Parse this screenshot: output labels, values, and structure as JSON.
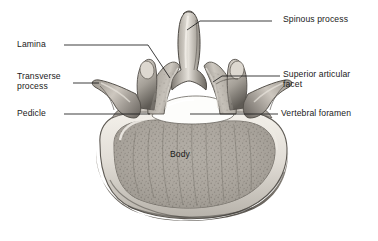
{
  "figure": {
    "view": "superior",
    "background_color": "#ffffff",
    "ink_color": "#1a1a1a",
    "bone_colors": {
      "rim_light": "#f2efe9",
      "bone_mid": "#b9b4ac",
      "bone_dark": "#76716b",
      "shadow": "#4a4742",
      "foramen": "#fdfdfb",
      "trabecular": "#a8a39b"
    }
  },
  "labels": [
    {
      "id": "spinous-process",
      "text": "Spinous process",
      "side": "right",
      "x": 283,
      "y": 14,
      "leader": "M 272 21 L 200 21 L 187 30"
    },
    {
      "id": "lamina",
      "text": "Lamina",
      "side": "left",
      "x": 17,
      "y": 39,
      "leader": "M 64 45 L 148 45 L 170 78"
    },
    {
      "id": "superior-articular-facet",
      "text": "Superior articular\nfacet",
      "side": "right",
      "x": 283,
      "y": 69,
      "leader": "M 280 76 L 222 76 L 213 82"
    },
    {
      "id": "transverse-process",
      "text": "Transverse\nprocess",
      "side": "left",
      "x": 17,
      "y": 71,
      "leader": "M 73 83 L 99 83"
    },
    {
      "id": "pedicle",
      "text": "Pedicle",
      "side": "left",
      "x": 17,
      "y": 108,
      "leader": "M 64 114 L 150 114"
    },
    {
      "id": "vertebral-foramen",
      "text": "Vertebral foramen",
      "side": "right",
      "x": 281,
      "y": 108,
      "leader": "M 278 114 L 190 114"
    },
    {
      "id": "body",
      "text": "Body",
      "side": "center",
      "x": 170,
      "y": 149,
      "leader": ""
    }
  ],
  "caption": ""
}
